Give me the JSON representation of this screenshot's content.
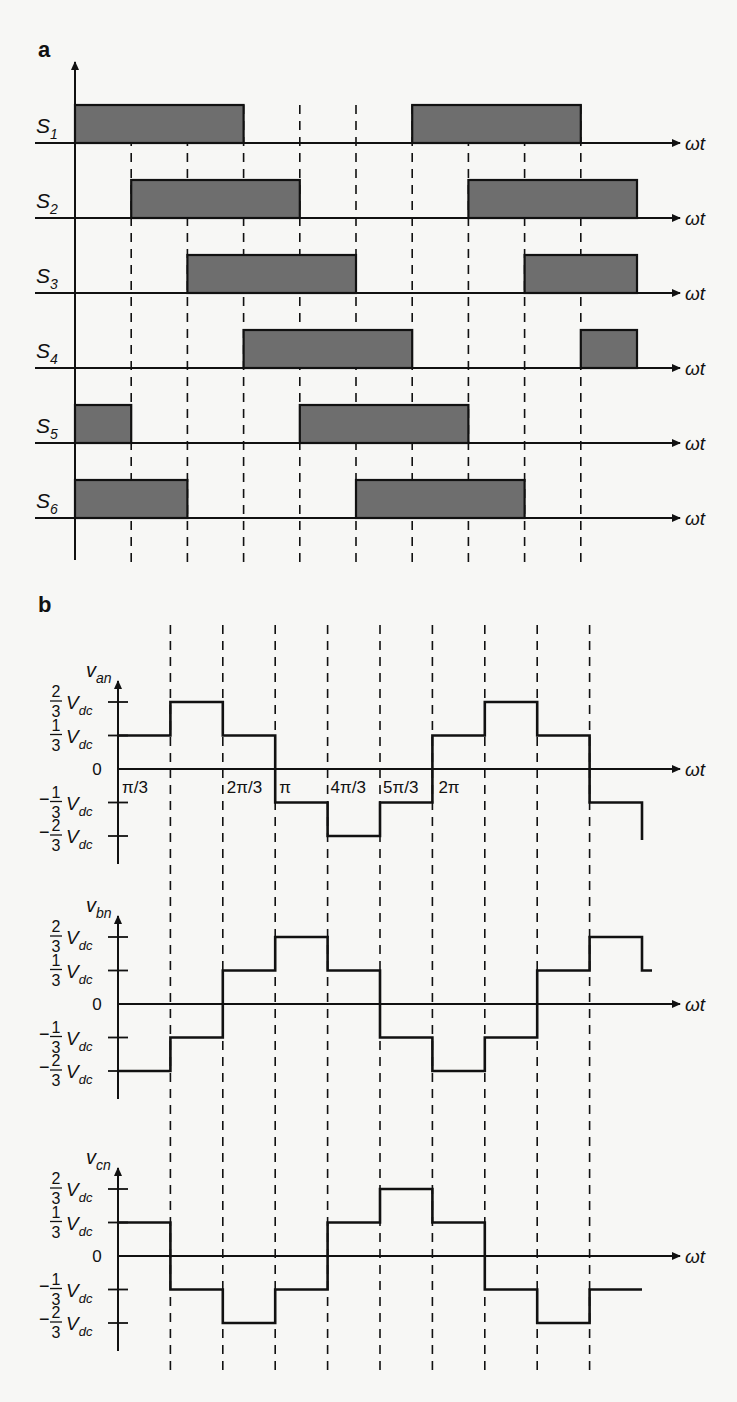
{
  "panels": {
    "a": {
      "label": "a"
    },
    "b": {
      "label": "b"
    }
  },
  "colors": {
    "pulse_fill": "#6e6e6e",
    "line": "#111111",
    "background": "#f7f7f5"
  },
  "chart_data": [
    {
      "type": "line",
      "title": "a — Switching signals S1–S6 (180° conduction)",
      "xlabel": "ωt",
      "x_unit": "π/3 intervals",
      "step_function": true,
      "x": [
        0,
        1,
        2,
        3,
        4,
        5,
        6,
        7,
        8,
        9,
        10
      ],
      "series": [
        {
          "name": "S1",
          "on_intervals": [
            [
              0,
              3
            ],
            [
              6,
              9
            ]
          ]
        },
        {
          "name": "S2",
          "on_intervals": [
            [
              1,
              4
            ],
            [
              7,
              10
            ]
          ]
        },
        {
          "name": "S3",
          "on_intervals": [
            [
              2,
              5
            ],
            [
              8,
              10
            ]
          ]
        },
        {
          "name": "S4",
          "on_intervals": [
            [
              3,
              6
            ],
            [
              9,
              10
            ]
          ]
        },
        {
          "name": "S5",
          "on_intervals": [
            [
              0,
              1
            ],
            [
              4,
              7
            ]
          ]
        },
        {
          "name": "S6",
          "on_intervals": [
            [
              0,
              2
            ],
            [
              5,
              8
            ]
          ]
        }
      ],
      "grid": "dashed vertical lines every π/3"
    },
    {
      "type": "line",
      "title": "b — Phase-to-neutral voltages",
      "xlabel": "ωt",
      "step_function": true,
      "x_tick_labels": [
        "π/3",
        "2π/3",
        "π",
        "4π/3",
        "5π/3",
        "2π"
      ],
      "y_tick_labels": [
        "2/3 Vdc",
        "1/3 Vdc",
        "0",
        "-1/3 Vdc",
        "-2/3 Vdc"
      ],
      "y_unit": "Vdc/3",
      "ylim": [
        -2,
        2
      ],
      "x_intervals": [
        "0–π/3",
        "π/3–2π/3",
        "2π/3–π",
        "π–4π/3",
        "4π/3–5π/3",
        "5π/3–2π",
        "2π–7π/3",
        "7π/3–8π/3",
        "8π/3–3π",
        "3π–10π/3"
      ],
      "series": [
        {
          "name": "v_an",
          "values": [
            1,
            2,
            1,
            -1,
            -2,
            -1,
            1,
            2,
            1,
            -1
          ]
        },
        {
          "name": "v_bn",
          "values": [
            -2,
            -1,
            1,
            2,
            1,
            -1,
            -2,
            -1,
            1,
            2
          ]
        },
        {
          "name": "v_cn",
          "values": [
            1,
            -1,
            -2,
            -1,
            1,
            2,
            1,
            -1,
            -2,
            -1
          ]
        }
      ],
      "grid": "dashed vertical lines every π/3"
    }
  ],
  "text": {
    "omega_t": "ωt",
    "s_labels": [
      "S",
      "S",
      "S",
      "S",
      "S",
      "S"
    ],
    "s_subs": [
      "1",
      "2",
      "3",
      "4",
      "5",
      "6"
    ],
    "v_names": [
      "v",
      "v",
      "v"
    ],
    "v_subs": [
      "an",
      "bn",
      "cn"
    ],
    "vdc": "V",
    "vdc_sub": "dc",
    "zero": "0",
    "frac_two": "2",
    "frac_one": "1",
    "frac_den": "3",
    "minus": "−",
    "ticks": [
      "π/3",
      "2π/3",
      "π",
      "4π/3",
      "5π/3",
      "2π"
    ]
  }
}
